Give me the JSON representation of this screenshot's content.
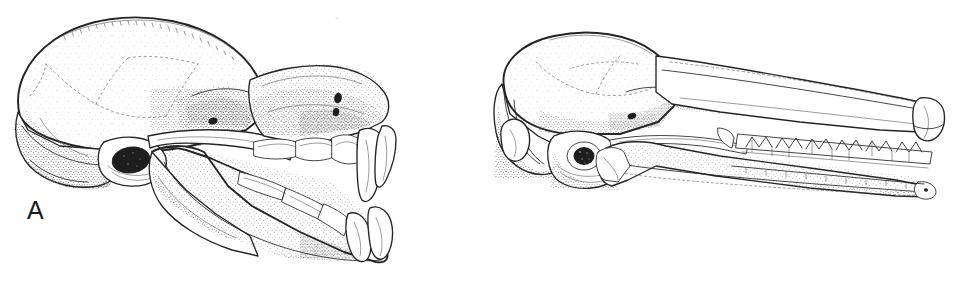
{
  "figure": {
    "kind": "scientific-line-illustration",
    "technique": "pen-and-ink stipple drawing",
    "background_color": "#ffffff",
    "ink_color": "#242424",
    "panel_count": 2
  },
  "panels": [
    {
      "id": "A",
      "label": "A",
      "label_position": {
        "x": 27,
        "y": 198
      },
      "view": "lateral (left side), rostrum to the right",
      "description": "Short-faced skull with a large, globose braincase, abruptly shortened rostrum, heterodont dentition bearing large upper and lower canines, and a deep mandible with a broad ascending ramus.",
      "bounds": {
        "x": 8,
        "y": 16,
        "width": 392,
        "height": 256
      },
      "features": [
        "globose braincase",
        "low sagittal crest",
        "complete zygomatic arch",
        "large orbit",
        "external auditory meatus",
        "short rostrum",
        "large upper canine",
        "large lower canine",
        "premolar row",
        "molar row",
        "deep mandibular ramus",
        "coronoid process",
        "angular process",
        "mental foramen"
      ]
    },
    {
      "id": "B",
      "label": "B",
      "label_position": {
        "x": 32,
        "y": 198
      },
      "view": "lateral (left side), rostrum to the right",
      "description": "Long-faced skull with a low, flattened braincase, greatly elongated slender rostrum, strongly inflated auditory bulla, and a long row of small W-shaped (dilambdodont) cheek teeth set in a slender tapering mandible.",
      "bounds": {
        "x": 15,
        "y": 36,
        "width": 455,
        "height": 160
      },
      "features": [
        "low flattened braincase",
        "lambdoid crest",
        "occipital condyle",
        "inflated auditory bulla",
        "slender zygomatic arch",
        "elongated rostrum",
        "infraorbital foramen",
        "dilambdodont molar row",
        "small anterior teeth",
        "slender tapering mandible"
      ]
    }
  ]
}
